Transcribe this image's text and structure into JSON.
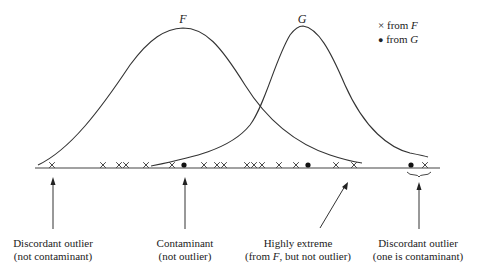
{
  "curves": {
    "F": {
      "label": "F",
      "peak_x": 183,
      "peak_y": 28
    },
    "G": {
      "label": "G",
      "peak_x": 301,
      "peak_y": 26
    }
  },
  "legend": {
    "cross": {
      "symbol": "×",
      "text": "from ",
      "dist": "F"
    },
    "dot": {
      "symbol": "●",
      "text": "from ",
      "dist": "G"
    }
  },
  "axis": {
    "y": 168,
    "x_start": 35,
    "x_end": 440
  },
  "points": [
    {
      "x": 52,
      "type": "cross"
    },
    {
      "x": 103,
      "type": "cross"
    },
    {
      "x": 119,
      "type": "cross"
    },
    {
      "x": 126,
      "type": "cross"
    },
    {
      "x": 146,
      "type": "cross"
    },
    {
      "x": 172,
      "type": "cross"
    },
    {
      "x": 184,
      "type": "dot"
    },
    {
      "x": 204,
      "type": "cross"
    },
    {
      "x": 217,
      "type": "cross"
    },
    {
      "x": 224,
      "type": "cross"
    },
    {
      "x": 247,
      "type": "cross"
    },
    {
      "x": 254,
      "type": "cross"
    },
    {
      "x": 262,
      "type": "cross"
    },
    {
      "x": 279,
      "type": "cross"
    },
    {
      "x": 296,
      "type": "cross"
    },
    {
      "x": 308,
      "type": "dot"
    },
    {
      "x": 336,
      "type": "cross"
    },
    {
      "x": 354,
      "type": "cross"
    },
    {
      "x": 411,
      "type": "dot"
    },
    {
      "x": 425,
      "type": "cross"
    }
  ],
  "annotations": [
    {
      "line1": "Discordant outlier",
      "line2": "(not contaminant)",
      "x": 53
    },
    {
      "line1": "Contaminant",
      "line2": "(not outlier)",
      "x": 185
    },
    {
      "line1": "Highly extreme",
      "line2_pre": "(from ",
      "line2_em": "F",
      "line2_post": ", but not outlier)",
      "x": 298
    },
    {
      "line1": "Discordant outlier",
      "line2": "(one is contaminant)",
      "x": 418
    }
  ]
}
